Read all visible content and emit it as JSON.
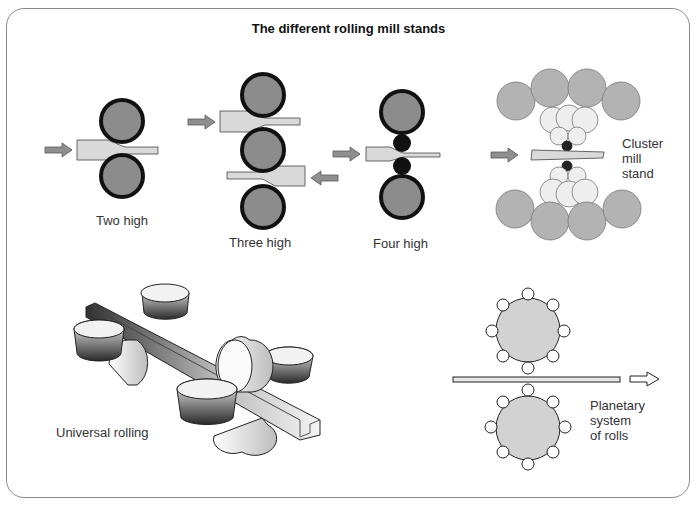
{
  "title": "The different rolling mill stands",
  "stands": {
    "two_high": {
      "label": "Two high",
      "roll_count": 2
    },
    "three_high": {
      "label": "Three high",
      "roll_count": 3
    },
    "four_high": {
      "label": "Four high",
      "roll_count": 4
    },
    "cluster": {
      "label_lines": [
        "Cluster",
        "mill",
        "stand"
      ]
    },
    "universal": {
      "label": "Universal rolling"
    },
    "planetary": {
      "label_lines": [
        "Planetary",
        "system",
        "of rolls"
      ],
      "planet_rolls_per_side": 8
    }
  },
  "colors": {
    "roll_fill": "#8c8c8c",
    "roll_outline": "#111111",
    "strip_fill": "#d9d9d9",
    "arrow_fill": "#8f8f8f",
    "cluster_large": "#b3b3b3",
    "cluster_small": "#eeeeee",
    "planetary_fill": "#d2d2d2"
  }
}
